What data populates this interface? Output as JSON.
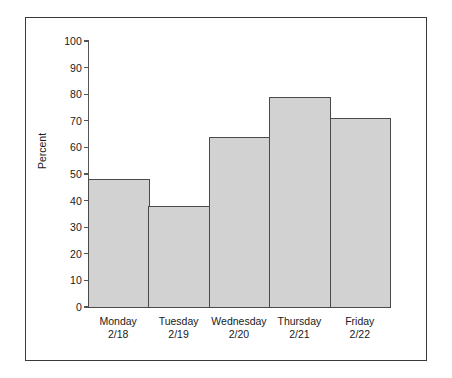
{
  "chart_data": {
    "type": "bar",
    "title": "",
    "xlabel": "",
    "ylabel": "Percent",
    "ylim": [
      0,
      100
    ],
    "yticks": [
      0,
      10,
      20,
      30,
      40,
      50,
      60,
      70,
      80,
      90,
      100
    ],
    "ytick_labels": [
      "0",
      "10",
      "20",
      "30",
      "40",
      "50",
      "60",
      "70",
      "80",
      "90",
      "100"
    ],
    "grid": false,
    "legend": null,
    "bar_style": {
      "fill": "#d2d2d2",
      "edge": "#4a4a4a",
      "gap": 0
    },
    "categories": [
      "Monday 2/18",
      "Tuesday 2/19",
      "Wednesday 2/20",
      "Thursday 2/21",
      "Friday 2/22"
    ],
    "category_lines": [
      {
        "day": "Monday",
        "date": "2/18"
      },
      {
        "day": "Tuesday",
        "date": "2/19"
      },
      {
        "day": "Wednesday",
        "date": "2/20"
      },
      {
        "day": "Thursday",
        "date": "2/21"
      },
      {
        "day": "Friday",
        "date": "2/22"
      }
    ],
    "values": [
      48,
      38,
      64,
      79,
      71
    ]
  },
  "figure": {
    "background": "#ffffff",
    "border_color": "#3a3a3a"
  }
}
